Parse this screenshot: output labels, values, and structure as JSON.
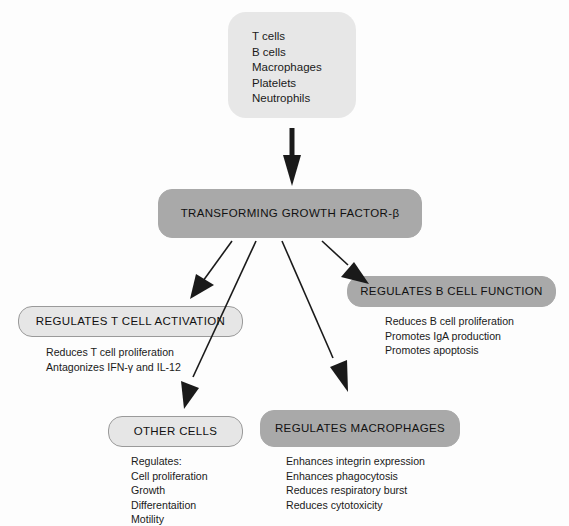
{
  "diagram": {
    "source": {
      "name": "cell-sources",
      "lines": "T cells\nB cells\nMacrophages\nPlatelets\nNeutrophils",
      "items": [
        "T cells",
        "B cells",
        "Macrophages",
        "Platelets",
        "Neutrophils"
      ]
    },
    "cytokine": {
      "name": "transforming-growth-factor-beta",
      "label": "TRANSFORMING GROWTH FACTOR-β"
    },
    "effects": [
      {
        "id": "t-cell-activation",
        "title": "REGULATES T CELL ACTIVATION",
        "style": "light",
        "lines": "Reduces T cell proliferation\nAntagonizes IFN-γ and IL-12",
        "items": [
          "Reduces T cell proliferation",
          "Antagonizes IFN-γ and IL-12"
        ]
      },
      {
        "id": "b-cell-function",
        "title": "REGULATES B CELL FUNCTION",
        "style": "dark",
        "lines": "Reduces B cell proliferation\nPromotes IgA production\nPromotes apoptosis",
        "items": [
          "Reduces B cell proliferation",
          "Promotes IgA production",
          "Promotes apoptosis"
        ]
      },
      {
        "id": "other-cells",
        "title": "OTHER CELLS",
        "style": "light",
        "lines": "Regulates:\nCell proliferation\nGrowth\nDifferentaition\nMotility",
        "items": [
          "Regulates:",
          "Cell proliferation",
          "Growth",
          "Differentaition",
          "Motility"
        ]
      },
      {
        "id": "macrophages",
        "title": "REGULATES MACROPHAGES",
        "style": "dark",
        "lines": "Enhances integrin expression\nEnhances phagocytosis\nReduces respiratory burst\nReduces cytotoxicity",
        "items": [
          "Enhances integrin expression",
          "Enhances phagocytosis",
          "Reduces respiratory burst",
          "Reduces cytotoxicity"
        ]
      }
    ],
    "colors": {
      "background": "#fdfdfd",
      "box_light": "#e6e6e6",
      "box_plain": "#e7e7e7",
      "box_dark": "#a9a9a9",
      "border": "#9a9a9a",
      "arrow": "#1a1a1a",
      "text": "#1a1a1a"
    }
  }
}
